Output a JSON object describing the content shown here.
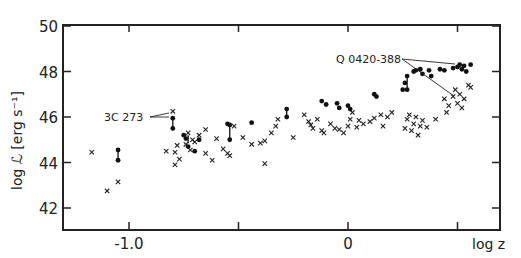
{
  "chart_data": {
    "type": "scatter",
    "title": "",
    "xlabel": "log z",
    "ylabel": "log ℒ [erg s⁻¹]",
    "xlim": [
      -1.28,
      0.7
    ],
    "ylim": [
      41.0,
      50.0
    ],
    "x_ticks": [
      -1.0,
      -0.5,
      0,
      0.5
    ],
    "x_tick_labels": [
      "-1.0",
      "",
      "0",
      ""
    ],
    "y_ticks": [
      42,
      44,
      46,
      48,
      50
    ],
    "y_tick_labels": [
      "42",
      "44",
      "46",
      "48",
      "50"
    ],
    "grid": false,
    "legend": "none",
    "annotations": [
      {
        "text": "3C 273",
        "x": -0.8,
        "y": 46.1
      },
      {
        "text": "Q 0420-388",
        "x": 0.3,
        "y": 48.4
      }
    ],
    "series": [
      {
        "name": "crosses",
        "marker": "x",
        "points": [
          [
            -1.17,
            44.45
          ],
          [
            -1.1,
            42.75
          ],
          [
            -1.05,
            43.15
          ],
          [
            -0.8,
            46.25
          ],
          [
            -0.83,
            44.5
          ],
          [
            -0.79,
            44.45
          ],
          [
            -0.78,
            44.75
          ],
          [
            -0.77,
            44.15
          ],
          [
            -0.79,
            43.9
          ],
          [
            -0.74,
            44.8
          ],
          [
            -0.71,
            45.0
          ],
          [
            -0.73,
            45.3
          ],
          [
            -0.72,
            44.55
          ],
          [
            -0.7,
            44.9
          ],
          [
            -0.68,
            45.2
          ],
          [
            -0.65,
            45.45
          ],
          [
            -0.6,
            45.05
          ],
          [
            -0.57,
            44.6
          ],
          [
            -0.55,
            44.4
          ],
          [
            -0.54,
            44.3
          ],
          [
            -0.52,
            45.6
          ],
          [
            -0.65,
            44.4
          ],
          [
            -0.62,
            44.1
          ],
          [
            -0.48,
            45.1
          ],
          [
            -0.44,
            44.8
          ],
          [
            -0.4,
            44.85
          ],
          [
            -0.38,
            44.95
          ],
          [
            -0.35,
            45.3
          ],
          [
            -0.33,
            45.6
          ],
          [
            -0.32,
            45.9
          ],
          [
            -0.38,
            43.95
          ],
          [
            -0.25,
            45.1
          ],
          [
            -0.2,
            46.1
          ],
          [
            -0.18,
            45.8
          ],
          [
            -0.17,
            45.65
          ],
          [
            -0.16,
            45.5
          ],
          [
            -0.14,
            45.9
          ],
          [
            -0.12,
            45.4
          ],
          [
            -0.11,
            45.3
          ],
          [
            -0.08,
            45.7
          ],
          [
            -0.06,
            45.5
          ],
          [
            -0.04,
            45.45
          ],
          [
            -0.02,
            45.3
          ],
          [
            0.0,
            45.6
          ],
          [
            0.01,
            45.9
          ],
          [
            0.02,
            46.2
          ],
          [
            0.04,
            45.55
          ],
          [
            0.05,
            45.85
          ],
          [
            0.07,
            45.7
          ],
          [
            0.1,
            45.8
          ],
          [
            0.12,
            45.95
          ],
          [
            0.15,
            46.1
          ],
          [
            0.16,
            45.6
          ],
          [
            0.18,
            46.0
          ],
          [
            0.2,
            46.2
          ],
          [
            0.26,
            45.5
          ],
          [
            0.27,
            45.9
          ],
          [
            0.28,
            46.1
          ],
          [
            0.29,
            45.4
          ],
          [
            0.3,
            45.7
          ],
          [
            0.31,
            46.0
          ],
          [
            0.32,
            45.2
          ],
          [
            0.33,
            45.6
          ],
          [
            0.34,
            45.85
          ],
          [
            0.36,
            45.55
          ],
          [
            0.4,
            45.9
          ],
          [
            0.44,
            46.8
          ],
          [
            0.45,
            46.2
          ],
          [
            0.46,
            46.5
          ],
          [
            0.48,
            46.9
          ],
          [
            0.5,
            46.6
          ],
          [
            0.51,
            47.0
          ],
          [
            0.52,
            46.4
          ],
          [
            0.53,
            46.8
          ],
          [
            0.55,
            47.4
          ],
          [
            0.56,
            47.3
          ],
          [
            0.49,
            47.2
          ]
        ]
      },
      {
        "name": "dots",
        "marker": "o",
        "points": [
          [
            -1.05,
            44.55
          ],
          [
            -1.05,
            44.1
          ],
          [
            -0.8,
            45.95
          ],
          [
            -0.8,
            45.5
          ],
          [
            -0.75,
            45.2
          ],
          [
            -0.74,
            45.05
          ],
          [
            -0.73,
            44.7
          ],
          [
            -0.7,
            44.5
          ],
          [
            -0.68,
            45.0
          ],
          [
            -0.55,
            45.7
          ],
          [
            -0.54,
            45.65
          ],
          [
            -0.54,
            45.0
          ],
          [
            -0.44,
            45.75
          ],
          [
            -0.28,
            46.35
          ],
          [
            -0.28,
            46.0
          ],
          [
            -0.12,
            46.7
          ],
          [
            -0.1,
            46.55
          ],
          [
            -0.05,
            46.6
          ],
          [
            -0.04,
            46.4
          ],
          [
            0.0,
            46.5
          ],
          [
            0.01,
            46.35
          ],
          [
            0.12,
            47.0
          ],
          [
            0.13,
            46.9
          ],
          [
            0.25,
            47.2
          ],
          [
            0.26,
            47.5
          ],
          [
            0.27,
            47.8
          ],
          [
            0.27,
            47.2
          ],
          [
            0.3,
            48.0
          ],
          [
            0.31,
            48.05
          ],
          [
            0.33,
            48.1
          ],
          [
            0.34,
            47.9
          ],
          [
            0.37,
            48.05
          ],
          [
            0.38,
            47.8
          ],
          [
            0.42,
            48.1
          ],
          [
            0.44,
            48.05
          ],
          [
            0.48,
            48.15
          ],
          [
            0.5,
            48.2
          ],
          [
            0.51,
            48.3
          ],
          [
            0.52,
            48.1
          ],
          [
            0.53,
            48.25
          ],
          [
            0.54,
            48.0
          ],
          [
            0.56,
            48.3
          ]
        ]
      }
    ],
    "connectors": [
      [
        [
          -1.05,
          44.55
        ],
        [
          -1.05,
          44.1
        ]
      ],
      [
        [
          -0.8,
          45.95
        ],
        [
          -0.8,
          45.5
        ]
      ],
      [
        [
          -0.54,
          45.7
        ],
        [
          -0.54,
          45.0
        ]
      ],
      [
        [
          -0.28,
          46.35
        ],
        [
          -0.28,
          46.0
        ]
      ],
      [
        [
          0.27,
          47.8
        ],
        [
          0.27,
          47.2
        ]
      ],
      [
        [
          -0.73,
          45.2
        ],
        [
          -0.73,
          44.85
        ]
      ]
    ]
  }
}
